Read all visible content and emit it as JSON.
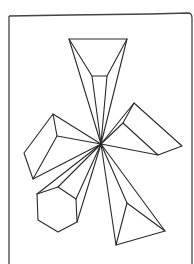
{
  "drawing": {
    "description": "Hand-drawn line sketch of geometric solids radiating from a central vanishing point inside a rough frame",
    "stroke_color": "#2a2a2a",
    "background": "#ffffff",
    "center": [
      101,
      144
    ],
    "shapes": [
      {
        "name": "top-trapezoid-prism",
        "outer": [
          [
            69,
            39
          ],
          [
            127,
            39
          ],
          [
            107,
            76
          ],
          [
            92,
            76
          ]
        ],
        "rays_from": [
          [
            69,
            39
          ],
          [
            92,
            76
          ],
          [
            107,
            76
          ],
          [
            127,
            39
          ]
        ]
      },
      {
        "name": "left-box-prism",
        "outer": [
          [
            53,
            114
          ],
          [
            24,
            153
          ],
          [
            33,
            179
          ],
          [
            57,
            136
          ]
        ],
        "rays_from": [
          [
            53,
            114
          ],
          [
            57,
            136
          ],
          [
            33,
            179
          ]
        ]
      },
      {
        "name": "right-wedge-prism",
        "outer": [
          [
            134,
            103
          ],
          [
            182,
            146
          ],
          [
            158,
            155
          ],
          [
            123,
            123
          ]
        ],
        "rays_from": [
          [
            134,
            103
          ],
          [
            123,
            123
          ],
          [
            158,
            155
          ]
        ]
      },
      {
        "name": "hexagonal-prism",
        "outer": [
          [
            37,
            194
          ],
          [
            58,
            187
          ],
          [
            76,
            199
          ],
          [
            77,
            222
          ],
          [
            58,
            232
          ],
          [
            38,
            220
          ]
        ],
        "rays_from": [
          [
            37,
            194
          ],
          [
            58,
            187
          ],
          [
            76,
            199
          ],
          [
            77,
            222
          ]
        ]
      },
      {
        "name": "bottom-triangle-pyramid",
        "outer": [
          [
            127,
            203
          ],
          [
            165,
            231
          ],
          [
            116,
            245
          ]
        ],
        "rays_from": [
          [
            116,
            245
          ],
          [
            127,
            203
          ],
          [
            165,
            231
          ]
        ]
      }
    ]
  }
}
